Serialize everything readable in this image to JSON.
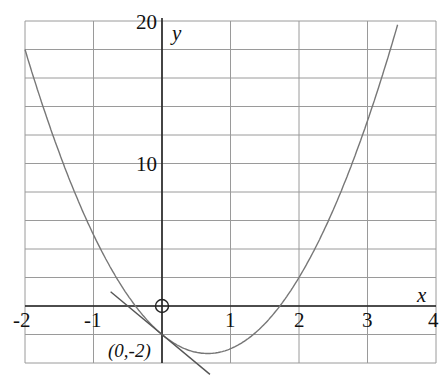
{
  "chart_data": {
    "type": "line",
    "title": "",
    "xlabel": "x",
    "ylabel": "y",
    "xlim": [
      -2,
      4
    ],
    "ylim": [
      -4,
      20
    ],
    "grid": true,
    "x_ticks": [
      "-2",
      "-1",
      "1",
      "2",
      "3",
      "4"
    ],
    "y_ticks": [
      "10",
      "20"
    ],
    "origin_marker": "circle-plus",
    "series": [
      {
        "name": "parabola y = 3x^2 - 4x - 2",
        "x": [
          -2,
          -1,
          0,
          0.667,
          1,
          2,
          3,
          3.45
        ],
        "y": [
          18,
          5,
          -2,
          -3.33,
          -3,
          2,
          13,
          20
        ]
      },
      {
        "name": "tangent line at (0,-2), y = -4x - 2",
        "x": [
          -0.75,
          0.7
        ],
        "y": [
          1,
          -4.8
        ]
      }
    ],
    "annotations": [
      {
        "text": "(0,-2)",
        "x": 0,
        "y": -2
      }
    ]
  },
  "labels": {
    "x_axis": "x",
    "y_axis": "y",
    "point": "(0,-2)",
    "ticks_x": [
      "-2",
      "-1",
      "1",
      "2",
      "3",
      "4"
    ],
    "ticks_y": [
      "10",
      "20"
    ]
  }
}
